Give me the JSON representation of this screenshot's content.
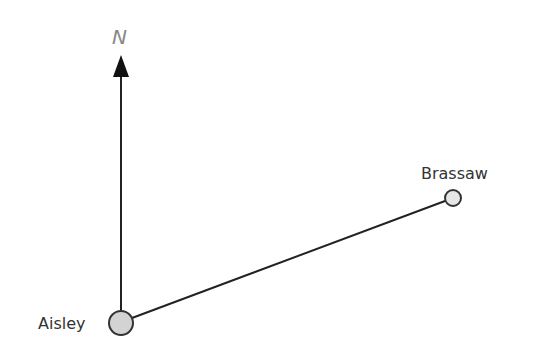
{
  "diagram": {
    "north_label": "N",
    "places": [
      {
        "name": "Aisley",
        "x": 121,
        "y": 323,
        "r": 12,
        "fill": "#d3d3d3"
      },
      {
        "name": "Brassaw",
        "x": 453,
        "y": 198,
        "r": 8,
        "fill": "#e6e6e6"
      }
    ],
    "colors": {
      "line": "#222222",
      "node_stroke": "#333333",
      "north_text": "#888888"
    }
  }
}
